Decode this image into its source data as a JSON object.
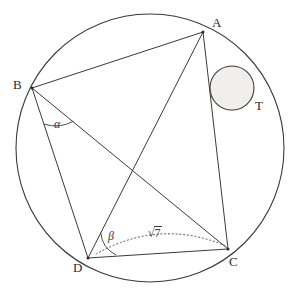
{
  "figure": {
    "kind": "geometry-diagram",
    "width": 294,
    "height": 293,
    "background": "#ffffff",
    "stroke_color": "#333333",
    "small_circle_fill": "#f0efed",
    "dotted_color": "#555555"
  },
  "circumcircle": {
    "label": "circumcircle",
    "cx": 150,
    "cy": 148,
    "r": 134
  },
  "incircle": {
    "label": "tangent-circle",
    "cx": 232,
    "cy": 88,
    "r": 22
  },
  "points": {
    "A": {
      "label": "A",
      "x": 203,
      "y": 32,
      "label_x": 212,
      "label_y": 16
    },
    "B": {
      "label": "B",
      "x": 32,
      "y": 88,
      "label_x": 13,
      "label_y": 78
    },
    "C": {
      "label": "C",
      "x": 228,
      "y": 249,
      "label_x": 229,
      "label_y": 255
    },
    "D": {
      "label": "D",
      "x": 88,
      "y": 258,
      "label_x": 73,
      "label_y": 261
    },
    "T": {
      "label": "T",
      "x": 253,
      "y": 98,
      "label_x": 255,
      "label_y": 99
    }
  },
  "segments": [
    {
      "name": "segment-AB",
      "from": "B",
      "to": "A"
    },
    {
      "name": "segment-BD",
      "from": "B",
      "to": "D"
    },
    {
      "name": "segment-BC",
      "from": "B",
      "to": "C"
    },
    {
      "name": "segment-AD",
      "from": "A",
      "to": "D"
    },
    {
      "name": "segment-AC",
      "from": "A",
      "to": "C"
    },
    {
      "name": "segment-DC",
      "from": "D",
      "to": "C"
    }
  ],
  "angles": {
    "alpha": {
      "symbol": "α",
      "vertex": "B",
      "between": "BD and BC",
      "label_x": 54,
      "label_y": 118
    },
    "beta": {
      "symbol": "β",
      "vertex": "D",
      "between": "DC and dotted arc",
      "label_x": 108,
      "label_y": 230
    }
  },
  "measures": {
    "dc_arc": {
      "root_symbol": "√",
      "radicand": "7",
      "text": "√7",
      "label_x": 148,
      "label_y": 228
    }
  }
}
